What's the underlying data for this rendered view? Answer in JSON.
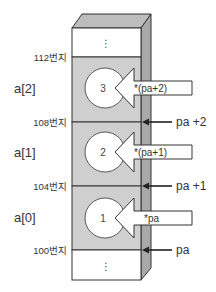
{
  "diagram": {
    "colors": {
      "cell_fill": "#cfcfcf",
      "side_fill": "#a9a9a9",
      "top_fill": "#bdbdbd",
      "empty_fill": "#ffffff",
      "stroke": "#333333",
      "arrow_fill": "#ffffff"
    },
    "ellipsis": "⋮",
    "addresses": [
      {
        "label": "112번지",
        "y": 57
      },
      {
        "label": "108번지",
        "y": 122
      },
      {
        "label": "104번지",
        "y": 186
      },
      {
        "label": "100번지",
        "y": 250
      }
    ],
    "elements": [
      {
        "name": "a[2]",
        "value": "3",
        "deref": "*(pa+2)",
        "pointer": "pa +2"
      },
      {
        "name": "a[1]",
        "value": "2",
        "deref": "*(pa+1)",
        "pointer": "pa +1"
      },
      {
        "name": "a[0]",
        "value": "1",
        "deref": "*pa",
        "pointer": "pa"
      }
    ]
  }
}
